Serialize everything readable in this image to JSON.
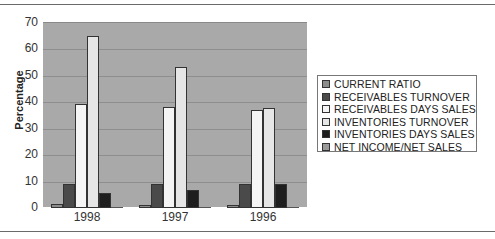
{
  "chart_data": {
    "type": "bar",
    "title": "",
    "xlabel": "",
    "ylabel": "Percentage",
    "ylim": [
      0,
      70
    ],
    "yticks": [
      0,
      10,
      20,
      30,
      40,
      50,
      60,
      70
    ],
    "grid": true,
    "legend_position": "right",
    "categories": [
      "1998",
      "1997",
      "1996"
    ],
    "series": [
      {
        "name": "CURRENT RATIO",
        "color": "#8c8c8c",
        "values": [
          1.5,
          1.3,
          1.2
        ]
      },
      {
        "name": "RECEIVABLES TURNOVER",
        "color": "#4a4a4a",
        "values": [
          9.1,
          9.2,
          9.2
        ]
      },
      {
        "name": "RECEIVABLES DAYS SALES",
        "color": "#f5f5f5",
        "values": [
          39.4,
          38.3,
          37.2
        ]
      },
      {
        "name": "INVENTORIES TURNOVER",
        "color": "#e6e6e6",
        "values": [
          64.9,
          53.5,
          38.0
        ]
      },
      {
        "name": "INVENTORIES DAYS SALES",
        "color": "#1e1e1e",
        "values": [
          5.6,
          6.7,
          9.1
        ]
      },
      {
        "name": "NET INCOME/NET SALES",
        "color": "#9a9a9a",
        "values": [
          0.2,
          0.2,
          0.2
        ]
      }
    ]
  },
  "axis": {
    "ylabel": "Percentage",
    "yticks": [
      "0",
      "10",
      "20",
      "30",
      "40",
      "50",
      "60",
      "70"
    ],
    "xticks": [
      "1998",
      "1997",
      "1996"
    ]
  },
  "legend": {
    "items": [
      "CURRENT RATIO",
      "RECEIVABLES TURNOVER",
      "RECEIVABLES DAYS SALES",
      "INVENTORIES TURNOVER",
      "INVENTORIES DAYS SALES",
      "NET INCOME/NET SALES"
    ]
  }
}
